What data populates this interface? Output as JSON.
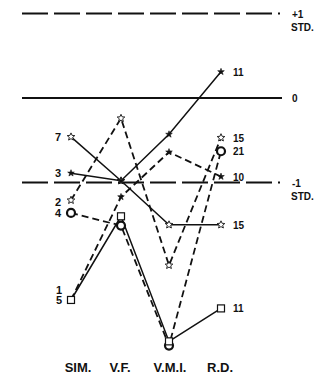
{
  "chart_data": {
    "type": "line",
    "title": "",
    "xlabel": "",
    "ylabel": "",
    "categories": [
      "SIM.",
      "V.F.",
      "V.M.I.",
      "R.D."
    ],
    "ylim": [
      -3.2,
      1.2
    ],
    "units": "standard deviations",
    "reference_lines": [
      {
        "value": 1,
        "label": "+1",
        "sublabel": "STD.",
        "style": "dashed"
      },
      {
        "value": 0,
        "label": "0",
        "sublabel": "",
        "style": "solid"
      },
      {
        "value": -1,
        "label": "-1",
        "sublabel": "STD.",
        "style": "dashed"
      }
    ],
    "series": [
      {
        "name": "7",
        "start_label": "7",
        "end_label": "15",
        "line": "solid",
        "marker": "star",
        "values": [
          -0.46,
          -0.98,
          -1.5,
          -1.5
        ]
      },
      {
        "name": "3",
        "start_label": "3",
        "end_label": "11",
        "line": "solid",
        "marker": "asterisk",
        "values": [
          -0.89,
          -0.98,
          -0.43,
          0.31
        ]
      },
      {
        "name": "2",
        "start_label": "2",
        "end_label": "15",
        "line": "dashed",
        "marker": "star",
        "values": [
          -1.21,
          -0.24,
          -1.98,
          -0.47
        ]
      },
      {
        "name": "4",
        "start_label": "4",
        "end_label": "21",
        "line": "dashed",
        "marker": "circle",
        "values": [
          -1.36,
          -1.51,
          -2.93,
          -0.63
        ]
      },
      {
        "name": "1",
        "start_label": "1",
        "end_label": "10",
        "line": "dashed",
        "marker": "asterisk",
        "values": [
          -2.39,
          -1.17,
          -0.64,
          -0.93
        ]
      },
      {
        "name": "5",
        "start_label": "5",
        "end_label": "11",
        "line": "solid",
        "marker": "square",
        "values": [
          -2.39,
          -1.4,
          -2.88,
          -2.49
        ]
      }
    ],
    "grid": false,
    "legend": "none"
  }
}
